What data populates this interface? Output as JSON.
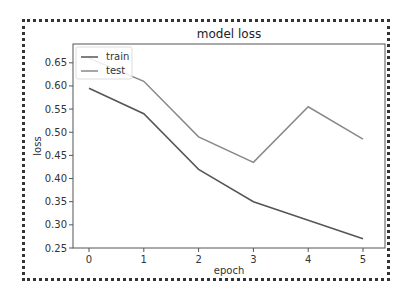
{
  "chart_data": {
    "type": "line",
    "title": "model loss",
    "xlabel": "epoch",
    "ylabel": "loss",
    "x": [
      0,
      1,
      2,
      3,
      4,
      5
    ],
    "xticks": [
      "0",
      "1",
      "2",
      "3",
      "4",
      "5"
    ],
    "yticks": [
      "0.25",
      "0.30",
      "0.35",
      "0.40",
      "0.45",
      "0.50",
      "0.55",
      "0.60",
      "0.65"
    ],
    "xlim": [
      -0.3,
      5.3
    ],
    "ylim": [
      0.25,
      0.69
    ],
    "grid": false,
    "legend_position": "upper left",
    "series": [
      {
        "name": "train",
        "color": "#555555",
        "values": [
          0.595,
          0.54,
          0.42,
          0.35,
          0.31,
          0.27
        ]
      },
      {
        "name": "test",
        "color": "#888888",
        "values": [
          0.66,
          0.61,
          0.49,
          0.435,
          0.555,
          0.485
        ]
      }
    ]
  },
  "legend": {
    "items": [
      {
        "label": "train"
      },
      {
        "label": "test"
      }
    ]
  }
}
